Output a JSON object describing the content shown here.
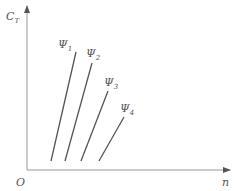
{
  "axes": {
    "y_label": "C",
    "y_label_sub": "T",
    "x_label": "n",
    "origin_label": "O"
  },
  "curves": [
    {
      "label": "Ψ",
      "sub": "1",
      "x1": 51,
      "y1": 161,
      "x2": 76,
      "y2": 52,
      "lx": 58,
      "ly": 48
    },
    {
      "label": "Ψ",
      "sub": "2",
      "x1": 65,
      "y1": 161,
      "x2": 92,
      "y2": 63,
      "lx": 86,
      "ly": 57
    },
    {
      "label": "Ψ",
      "sub": "3",
      "x1": 81,
      "y1": 161,
      "x2": 108,
      "y2": 91,
      "lx": 104,
      "ly": 86
    },
    {
      "label": "Ψ",
      "sub": "4",
      "x1": 99,
      "y1": 161,
      "x2": 124,
      "y2": 117,
      "lx": 120,
      "ly": 112
    }
  ],
  "colors": {
    "axis": "#888888",
    "line": "#555555",
    "text": "#555555"
  }
}
